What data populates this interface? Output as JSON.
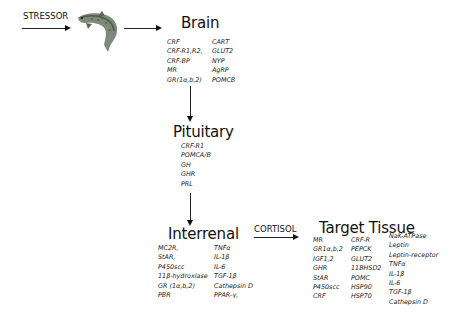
{
  "stressor": {
    "label": "STRESSOR"
  },
  "fish": {
    "icon": "trout-fish-icon"
  },
  "brain": {
    "title": "Brain",
    "col1": [
      "CRF",
      "CRF-R1,R2,",
      "CRF-BP",
      "MR",
      "GR(1α,b,2)"
    ],
    "col2": [
      "CART",
      "GLUT2",
      "NYP",
      "AgRP",
      "POMCB"
    ]
  },
  "pituitary": {
    "title": "Pituitary",
    "items": [
      "CRF-R1",
      "POMCA/B",
      "GH",
      "GHR",
      "PRL"
    ]
  },
  "interrenal": {
    "title": "Interrenal",
    "col1": [
      "MC2R,",
      "StAR,",
      "P450scc",
      "11β-hydroxlase",
      "GR (1α,b,2)",
      "PBR"
    ],
    "col2": [
      "TNFα",
      "IL-1β",
      "IL-6",
      "TGF-1β",
      "Cathepsin D",
      "PPAR-γ,"
    ]
  },
  "cortisol": {
    "label": "CORTISOL"
  },
  "target_tissue": {
    "title": "Target Tissue",
    "col1": [
      "MR",
      "GR1α,b,2",
      "IGF1,2",
      "GHR",
      "StAR",
      "P450scc",
      "CRF"
    ],
    "col2": [
      "CRF-R",
      "PEPCK",
      "GLUT2",
      "11BHSD2",
      "POMC",
      "HSP90",
      "HSP70"
    ],
    "col3": [
      "NaK-ATPase",
      "Leptin",
      "Leptin-receptor",
      "TNFα",
      "IL-1β",
      "IL-6",
      "TGF-1β",
      "Cathepsin D"
    ]
  },
  "colors": {
    "ink": "#111111",
    "background": "#ffffff",
    "fish_body": "#7d8a78",
    "fish_dark": "#4f5a4c"
  }
}
